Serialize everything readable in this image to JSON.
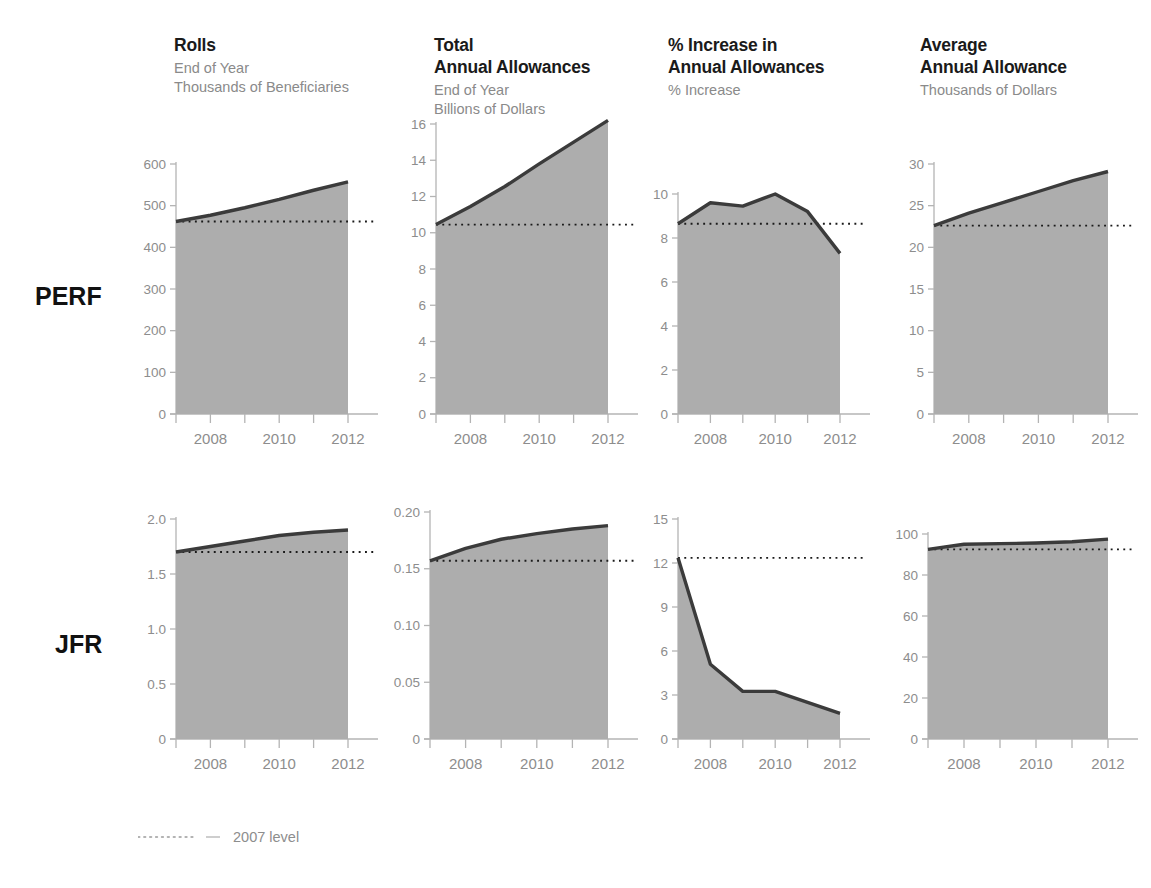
{
  "figure": {
    "row_labels": [
      "PERF",
      "JFR"
    ],
    "legend": {
      "label": "2007 level",
      "line_style": "dotted"
    },
    "colors": {
      "area_fill": "#adadad",
      "series_line": "#3b3b3b",
      "axis": "#b4b4b4",
      "tick_label": "#8d8d8d",
      "title": "#1a1a1a",
      "subtitle": "#8a8a8a",
      "reference_line": "#1a1a1a"
    },
    "columns": [
      {
        "title": "Rolls",
        "subtitle": "End of Year\nThousands of Beneficiaries"
      },
      {
        "title": "Total\nAnnual Allowances",
        "subtitle": "End of Year\nBillions of Dollars"
      },
      {
        "title": "% Increase in\n Annual Allowances",
        "subtitle": "% Increase"
      },
      {
        "title": "Average\nAnnual Allowance",
        "subtitle": "Thousands of Dollars"
      }
    ]
  },
  "chart_data": [
    {
      "type": "area",
      "title": "Rolls",
      "panel_row": "PERF",
      "xlabel": "",
      "ylabel": "Thousands of Beneficiaries",
      "x": [
        2007,
        2008,
        2009,
        2010,
        2011,
        2012
      ],
      "xtick_labels": [
        "",
        "2008",
        "",
        "2010",
        "",
        "2012"
      ],
      "values": [
        462,
        477,
        495,
        515,
        537,
        557
      ],
      "ylim": [
        0,
        600
      ],
      "yticks": [
        0,
        100,
        200,
        300,
        400,
        500,
        600
      ],
      "ytick_labels": [
        "0",
        "100",
        "200",
        "300",
        "400",
        "500",
        "600"
      ],
      "reference_line": {
        "label": "2007 level",
        "value": 462
      },
      "grid": false,
      "legend_position": "below-figure"
    },
    {
      "type": "area",
      "title": "Total Annual Allowances",
      "panel_row": "PERF",
      "xlabel": "",
      "ylabel": "Billions of Dollars",
      "x": [
        2007,
        2008,
        2009,
        2010,
        2011,
        2012
      ],
      "xtick_labels": [
        "",
        "2008",
        "",
        "2010",
        "",
        "2012"
      ],
      "values": [
        10.45,
        11.45,
        12.55,
        13.8,
        15.0,
        16.2
      ],
      "ylim": [
        0,
        16
      ],
      "yticks": [
        0,
        2,
        4,
        6,
        8,
        10,
        12,
        14,
        16
      ],
      "ytick_labels": [
        "0",
        "2",
        "4",
        "6",
        "8",
        "10",
        "12",
        "14",
        "16"
      ],
      "reference_line": {
        "label": "2007 level",
        "value": 10.45
      },
      "grid": false,
      "legend_position": "below-figure"
    },
    {
      "type": "area",
      "title": "% Increase in Annual Allowances",
      "panel_row": "PERF",
      "xlabel": "",
      "ylabel": "% Increase",
      "x": [
        2007,
        2008,
        2009,
        2010,
        2011,
        2012
      ],
      "xtick_labels": [
        "",
        "2008",
        "",
        "2010",
        "",
        "2012"
      ],
      "values": [
        8.65,
        9.6,
        9.45,
        10.0,
        9.2,
        7.3
      ],
      "ylim": [
        0,
        10
      ],
      "yticks": [
        0,
        2,
        4,
        6,
        8,
        10
      ],
      "ytick_labels": [
        "0",
        "2",
        "4",
        "6",
        "8",
        "10"
      ],
      "reference_line": {
        "label": "2007 level",
        "value": 8.65
      },
      "grid": false,
      "legend_position": "below-figure"
    },
    {
      "type": "area",
      "title": "Average Annual Allowance",
      "panel_row": "PERF",
      "xlabel": "",
      "ylabel": "Thousands of Dollars",
      "x": [
        2007,
        2008,
        2009,
        2010,
        2011,
        2012
      ],
      "xtick_labels": [
        "",
        "2008",
        "",
        "2010",
        "",
        "2012"
      ],
      "values": [
        22.6,
        24.1,
        25.4,
        26.7,
        28.0,
        29.1
      ],
      "ylim": [
        0,
        30
      ],
      "yticks": [
        0,
        5,
        10,
        15,
        20,
        25,
        30
      ],
      "ytick_labels": [
        "0",
        "5",
        "10",
        "15",
        "20",
        "25",
        "30"
      ],
      "reference_line": {
        "label": "2007 level",
        "value": 22.6
      },
      "grid": false,
      "legend_position": "below-figure"
    },
    {
      "type": "area",
      "title": "Rolls",
      "panel_row": "JFR",
      "xlabel": "",
      "ylabel": "Thousands of Beneficiaries",
      "x": [
        2007,
        2008,
        2009,
        2010,
        2011,
        2012
      ],
      "xtick_labels": [
        "",
        "2008",
        "",
        "2010",
        "",
        "2012"
      ],
      "values": [
        1.7,
        1.75,
        1.8,
        1.85,
        1.88,
        1.9
      ],
      "ylim": [
        0,
        2.0
      ],
      "yticks": [
        0,
        0.5,
        1.0,
        1.5,
        2.0
      ],
      "ytick_labels": [
        "0",
        "0.5",
        "1.0",
        "1.5",
        "2.0"
      ],
      "reference_line": {
        "label": "2007 level",
        "value": 1.7
      },
      "grid": false,
      "legend_position": "below-figure"
    },
    {
      "type": "area",
      "title": "Total Annual Allowances",
      "panel_row": "JFR",
      "xlabel": "",
      "ylabel": "Billions of Dollars",
      "x": [
        2007,
        2008,
        2009,
        2010,
        2011,
        2012
      ],
      "xtick_labels": [
        "",
        "2008",
        "",
        "2010",
        "",
        "2012"
      ],
      "values": [
        0.157,
        0.168,
        0.176,
        0.181,
        0.185,
        0.188
      ],
      "ylim": [
        0,
        0.2
      ],
      "yticks": [
        0,
        0.05,
        0.1,
        0.15,
        0.2
      ],
      "ytick_labels": [
        "0",
        "0.05",
        "0.10",
        "0.15",
        "0.20"
      ],
      "reference_line": {
        "label": "2007 level",
        "value": 0.157
      },
      "grid": false,
      "legend_position": "below-figure"
    },
    {
      "type": "area",
      "title": "% Increase in Annual Allowances",
      "panel_row": "JFR",
      "xlabel": "",
      "ylabel": "% Increase",
      "x": [
        2007,
        2008,
        2009,
        2010,
        2011,
        2012
      ],
      "xtick_labels": [
        "",
        "2008",
        "",
        "2010",
        "",
        "2012"
      ],
      "values": [
        12.35,
        5.1,
        3.25,
        3.25,
        2.5,
        1.75
      ],
      "ylim": [
        0,
        15
      ],
      "yticks": [
        0,
        3,
        6,
        9,
        12,
        15
      ],
      "ytick_labels": [
        "0",
        "3",
        "6",
        "9",
        "12",
        "15"
      ],
      "reference_line": {
        "label": "2007 level",
        "value": 12.35
      },
      "grid": false,
      "legend_position": "below-figure"
    },
    {
      "type": "area",
      "title": "Average Annual Allowance",
      "panel_row": "JFR",
      "xlabel": "",
      "ylabel": "Thousands of Dollars",
      "x": [
        2007,
        2008,
        2009,
        2010,
        2011,
        2012
      ],
      "xtick_labels": [
        "",
        "2008",
        "",
        "2010",
        "",
        "2012"
      ],
      "values": [
        92.5,
        95.0,
        95.3,
        95.6,
        96.2,
        97.5
      ],
      "ylim": [
        0,
        100
      ],
      "yticks": [
        0,
        20,
        40,
        60,
        80,
        100
      ],
      "ytick_labels": [
        "0",
        "20",
        "40",
        "60",
        "80",
        "100"
      ],
      "reference_line": {
        "label": "2007 level",
        "value": 92.5
      },
      "grid": false,
      "legend_position": "below-figure"
    }
  ]
}
